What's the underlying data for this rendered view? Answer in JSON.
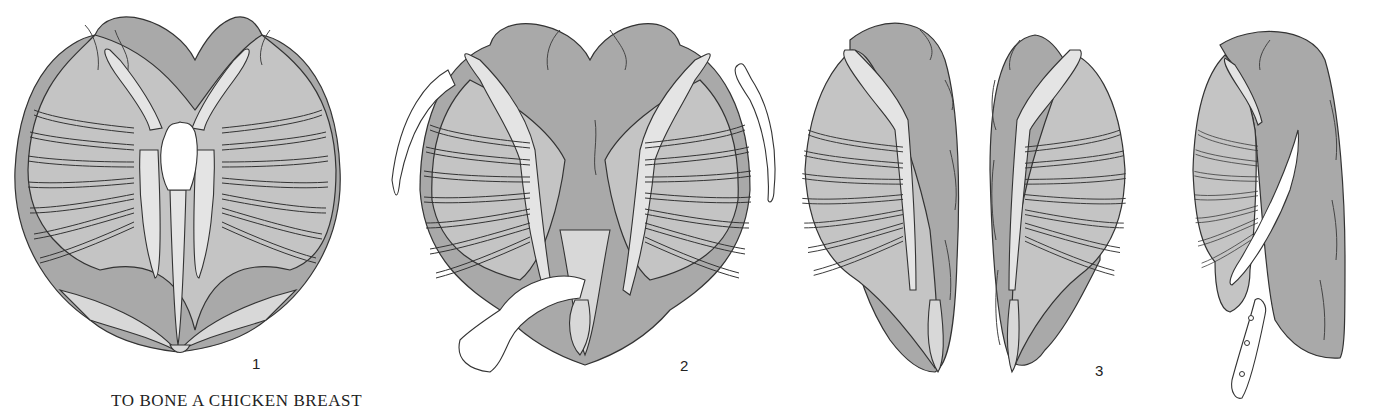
{
  "caption": "TO BONE A CHICKEN BREAST",
  "step_labels": [
    "1",
    "2",
    "3"
  ],
  "figures": [
    {
      "id": "figure-1",
      "step": "1",
      "depicts": "whole chicken breast, bone side up, with wishbone removed"
    },
    {
      "id": "figure-2",
      "step": "2",
      "depicts": "wishbone and keel bone being pulled away"
    },
    {
      "id": "figure-3a",
      "step": "3",
      "depicts": "breast split into two halves, left half"
    },
    {
      "id": "figure-3b",
      "step": "3",
      "depicts": "breast split into two halves, right half"
    },
    {
      "id": "figure-4",
      "step": "",
      "depicts": "knife scraping rib cage away from meat"
    }
  ],
  "colors": {
    "meat_dark": "#a9a9a9",
    "meat_mid": "#c4c4c4",
    "bone": "#e4e4e4",
    "outline": "#333333"
  }
}
